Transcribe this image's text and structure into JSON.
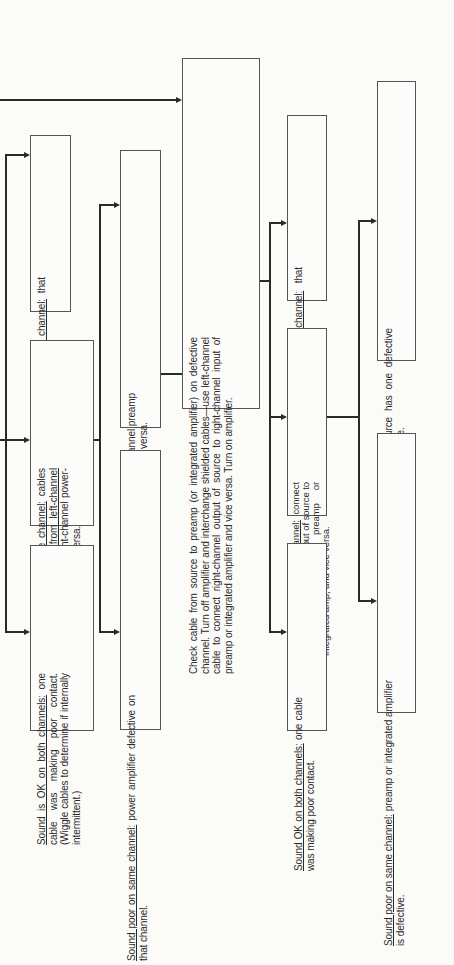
{
  "diagram": {
    "title": "",
    "boxes": {
      "b1": {
        "lead": "Sound poor on other channel:",
        "text": " that cable is defective."
      },
      "b2": {
        "lead": "Sound poor on same channel:",
        "text": " cables OK. ",
        "lead2": "Connect cable from left-channel",
        "text2": " pre-amp output to right-channel power-amp input, and vice versa."
      },
      "b3": {
        "lead": "Sound is OK on both channels:",
        "text": " one cable was making poor contact. (Wiggle cables to determine if internally intermittent.)"
      },
      "b4": {
        "lead": "Sound poor on other channel:",
        "text": " reconnect left-channel preamp output to left-channel power amp input and vice versa."
      },
      "b5": {
        "lead": "Sound poor on same channel:",
        "text": " power amplifier defective on that channel."
      },
      "b6": {
        "text": "Check cable from source to preamp (or integrated amplifier) on defective channel. Turn off amplifier and interchange shielded cables—use left-channel cable to connect right-channel output of source to right-channel input of preamp or integrated amplifier and vice versa. Turn on amplifier."
      },
      "b7": {
        "lead": "Sound poor on other channel:",
        "text": " that cable is defective."
      },
      "b8": {
        "lead": "Sound poor on same channel:",
        "text": " connect ",
        "lead2": "cable from left-channel",
        "text2": " output of source to right-channel input of preamp or integrated amp, and vice versa."
      },
      "b9": {
        "lead": "Sound OK on both channels:",
        "text": " one cable was making poor contact."
      },
      "b10": {
        "lead": "Sound poor on other channel:",
        "text": " source has one defective channel. Refer to chart for that source."
      },
      "b11": {
        "lead": "Sound poor on same channel:",
        "text": " preamp or integrated amplifier is defective."
      }
    }
  }
}
